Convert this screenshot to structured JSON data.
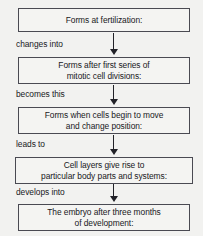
{
  "diagram": {
    "type": "vertical-flowchart",
    "background_color": "#f2f2f0",
    "box_border_color": "#4a4a52",
    "text_color": "#18181c",
    "arrow_color": "#222228",
    "nodes": [
      {
        "id": "node-0",
        "label": "Forms at fertilization:"
      },
      {
        "id": "node-1",
        "label": "Forms after first series of\nmitotic cell divisions:"
      },
      {
        "id": "node-2",
        "label": "Forms when cells begin to move\nand change position:"
      },
      {
        "id": "node-3",
        "label": "Cell layers give rise to\nparticular body parts and systems:"
      },
      {
        "id": "node-4",
        "label": "The embryo after three months\nof development:"
      }
    ],
    "connectors": [
      {
        "id": "conn-0",
        "label": "changes into",
        "from": "node-0",
        "to": "node-1",
        "icon": "down-arrow-icon"
      },
      {
        "id": "conn-1",
        "label": "becomes this",
        "from": "node-1",
        "to": "node-2",
        "icon": "down-arrow-icon"
      },
      {
        "id": "conn-2",
        "label": "leads to",
        "from": "node-2",
        "to": "node-3",
        "icon": "down-arrow-icon"
      },
      {
        "id": "conn-3",
        "label": "develops into",
        "from": "node-3",
        "to": "node-4",
        "icon": "down-arrow-icon"
      }
    ]
  }
}
